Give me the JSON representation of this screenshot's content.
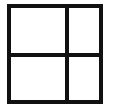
{
  "diagram": {
    "type": "grid",
    "rows": 2,
    "columns": 2,
    "line_color": "#111111",
    "background": "#ffffff",
    "cells": [
      {
        "row": 0,
        "col": 0,
        "label": ""
      },
      {
        "row": 0,
        "col": 1,
        "label": ""
      },
      {
        "row": 1,
        "col": 0,
        "label": ""
      },
      {
        "row": 1,
        "col": 1,
        "label": ""
      }
    ]
  }
}
